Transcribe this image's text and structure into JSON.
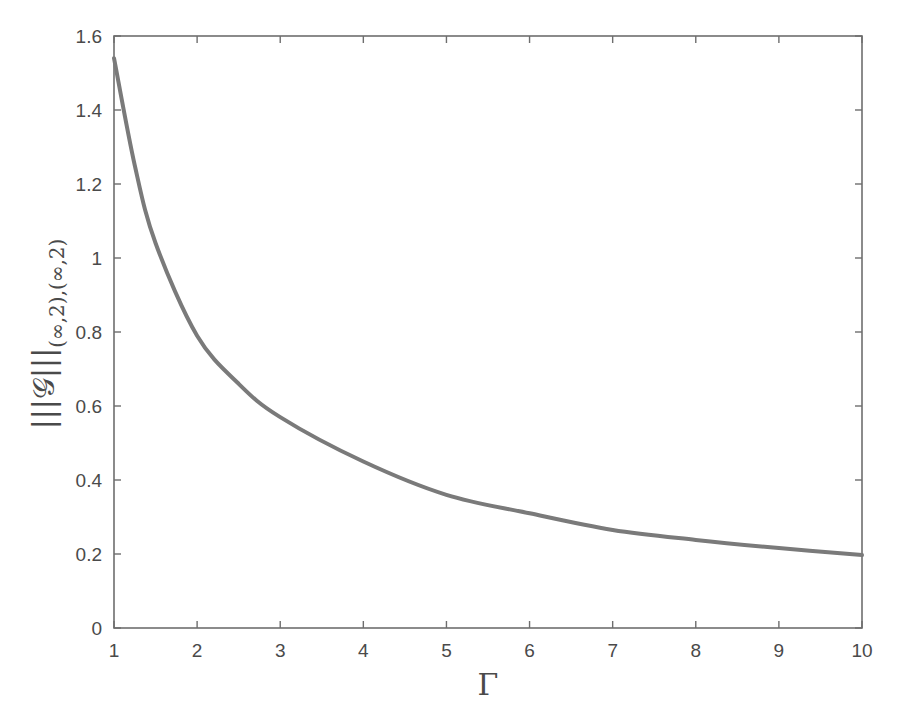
{
  "chart_data": {
    "type": "line",
    "title": "",
    "xlabel": "Γ",
    "ylabel": "|||𝒢|||(∞,2),(∞,2)",
    "ylabel_main": "|||𝒢|||",
    "ylabel_sub": "(∞,2),(∞,2)",
    "xlim": [
      1,
      10
    ],
    "ylim": [
      0,
      1.6
    ],
    "xticks": [
      1,
      2,
      3,
      4,
      5,
      6,
      7,
      8,
      9,
      10
    ],
    "xtick_labels": [
      "1",
      "2",
      "3",
      "4",
      "5",
      "6",
      "7",
      "8",
      "9",
      "10"
    ],
    "yticks": [
      0,
      0.2,
      0.4,
      0.6,
      0.8,
      1.0,
      1.2,
      1.4,
      1.6
    ],
    "ytick_labels": [
      "0",
      "0.2",
      "0.4",
      "0.6",
      "0.8",
      "1",
      "1.2",
      "1.4",
      "1.6"
    ],
    "grid": false,
    "legend": null,
    "series": [
      {
        "name": "|||𝒢|||(∞,2),(∞,2)",
        "color": "#7a7a7a",
        "x": [
          1,
          1.25,
          1.5,
          2,
          2.5,
          3,
          4,
          5,
          6,
          7,
          8,
          9,
          10
        ],
        "values": [
          1.54,
          1.25,
          1.04,
          0.79,
          0.66,
          0.57,
          0.45,
          0.36,
          0.31,
          0.265,
          0.238,
          0.216,
          0.197
        ]
      }
    ]
  },
  "caption": {
    "text": ""
  }
}
